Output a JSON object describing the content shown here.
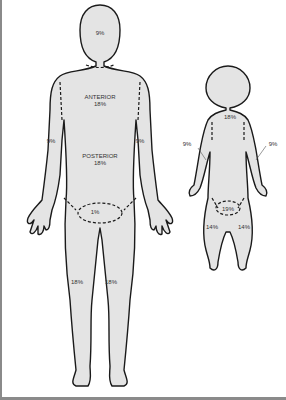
{
  "diagram": {
    "type": "rule-of-nines",
    "colors": {
      "body_fill": "#e4e4e4",
      "outline": "#1a1a1a",
      "label": "#333333",
      "frame": "#8a8a8a"
    },
    "adult": {
      "head": "9%",
      "trunk_front_title": "ANTERIOR",
      "trunk_front": "18%",
      "trunk_back_title": "POSTERIOR",
      "trunk_back": "18%",
      "arm_left": "9%",
      "arm_right": "9%",
      "perineum": "1%",
      "leg_left": "18%",
      "leg_right": "18%"
    },
    "infant": {
      "head": "18%",
      "arm_left": "9%",
      "arm_right": "9%",
      "trunk": "19%",
      "leg_left": "14%",
      "leg_right": "14%"
    }
  }
}
